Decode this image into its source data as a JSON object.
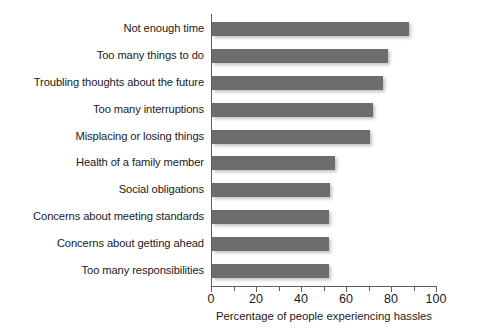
{
  "chart_data": {
    "type": "bar",
    "orientation": "horizontal",
    "title": "",
    "subtitle": "",
    "xlabel": "Percentage of people experiencing hassles",
    "ylabel": "",
    "xlim": [
      0,
      100
    ],
    "xticks": [
      0,
      20,
      40,
      60,
      80,
      100
    ],
    "xtick_labels": [
      "0",
      "20",
      "40",
      "60",
      "80",
      "100"
    ],
    "minor_xticks": [
      10,
      30,
      50,
      70,
      90
    ],
    "grid": false,
    "legend": false,
    "bar_color": "#6d6d6d",
    "categories": [
      "Not enough time",
      "Too many things to do",
      "Troubling thoughts about the future",
      "Too many interruptions",
      "Misplacing or losing things",
      "Health of a family member",
      "Social obligations",
      "Concerns about meeting standards",
      "Concerns about getting ahead",
      "Too many responsibilities"
    ],
    "values": [
      87.5,
      78,
      76,
      71.5,
      70,
      54.5,
      52.5,
      52,
      52,
      52
    ]
  }
}
